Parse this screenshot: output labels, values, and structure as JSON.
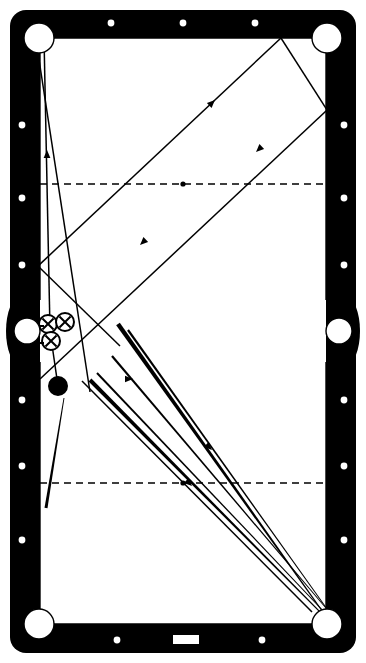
{
  "figure": {
    "type": "billiards-table-diagram",
    "width": 366,
    "height": 663,
    "colors": {
      "rail": "#000000",
      "cloth": "#ffffff",
      "line": "#000000",
      "pocket": "#ffffff"
    }
  },
  "table": {
    "name": "pool-table",
    "outer": {
      "x": 10,
      "y": 10,
      "w": 346,
      "h": 643,
      "radius": 16
    },
    "cushion_inner": {
      "x": 38,
      "y": 36,
      "w": 290,
      "h": 590
    },
    "playfield": {
      "x": 40,
      "y": 38,
      "w": 286,
      "h": 586
    }
  },
  "pockets": [
    {
      "name": "pocket-top-left",
      "cx": 39,
      "cy": 38,
      "r": 15
    },
    {
      "name": "pocket-top-right",
      "cx": 327,
      "cy": 38,
      "r": 15
    },
    {
      "name": "pocket-side-left",
      "cx": 27,
      "cy": 331,
      "r": 13
    },
    {
      "name": "pocket-side-right",
      "cx": 339,
      "cy": 331,
      "r": 13
    },
    {
      "name": "pocket-bottom-left",
      "cx": 39,
      "cy": 624,
      "r": 15
    },
    {
      "name": "pocket-bottom-right",
      "cx": 327,
      "cy": 624,
      "r": 15
    }
  ],
  "diamonds": {
    "top": [
      {
        "cx": 111,
        "cy": 23
      },
      {
        "cx": 183,
        "cy": 23
      },
      {
        "cx": 255,
        "cy": 23
      }
    ],
    "bottom": [
      {
        "cx": 117,
        "cy": 640
      },
      {
        "cx": 262,
        "cy": 640
      }
    ],
    "bottom_center_mark": {
      "x": 173,
      "y": 635,
      "w": 26,
      "h": 9
    },
    "left": [
      {
        "cx": 22,
        "cy": 125
      },
      {
        "cx": 22,
        "cy": 198
      },
      {
        "cx": 22,
        "cy": 265
      },
      {
        "cx": 22,
        "cy": 400
      },
      {
        "cx": 22,
        "cy": 466
      },
      {
        "cx": 22,
        "cy": 540
      }
    ],
    "right": [
      {
        "cx": 344,
        "cy": 125
      },
      {
        "cx": 344,
        "cy": 198
      },
      {
        "cx": 344,
        "cy": 265
      },
      {
        "cx": 344,
        "cy": 400
      },
      {
        "cx": 344,
        "cy": 466
      },
      {
        "cx": 344,
        "cy": 540
      }
    ]
  },
  "strings": [
    {
      "name": "head-string",
      "y": 184,
      "x1": 40,
      "x2": 326,
      "style": "dashed",
      "spot": {
        "cx": 183,
        "cy": 184,
        "r": 2.6
      }
    },
    {
      "name": "foot-string",
      "y": 483,
      "x1": 40,
      "x2": 326,
      "style": "dashed",
      "spot": {
        "cx": 183,
        "cy": 483,
        "r": 2.6
      }
    }
  ],
  "balls": [
    {
      "name": "object-ball-x-1",
      "cx": 48,
      "cy": 324,
      "r": 9,
      "mark": "X",
      "fill": "white"
    },
    {
      "name": "object-ball-x-2",
      "cx": 65,
      "cy": 322,
      "r": 9,
      "mark": "X",
      "fill": "white"
    },
    {
      "name": "object-ball-x-3",
      "cx": 51,
      "cy": 341,
      "r": 9,
      "mark": "X",
      "fill": "white"
    },
    {
      "name": "cue-ball-solid",
      "cx": 58,
      "cy": 386,
      "r": 9,
      "mark": "",
      "fill": "black"
    }
  ],
  "pocket_arrows": [
    {
      "name": "pocket-entry-arrow-upper",
      "x1": 44,
      "y1": 326,
      "x2": 30,
      "y2": 326
    },
    {
      "name": "pocket-entry-arrow-lower",
      "x1": 44,
      "y1": 343,
      "x2": 30,
      "y2": 343
    }
  ],
  "thin_paths": [
    {
      "name": "path-long-bank",
      "points": [
        [
          44,
          38
        ],
        [
          50,
          330
        ]
      ],
      "arrows": [
        {
          "x": 47,
          "y": 150,
          "dir": "up"
        }
      ]
    },
    {
      "name": "path-cue-rail-return",
      "points": [
        [
          36,
          40
        ],
        [
          90,
          392
        ]
      ],
      "arrows": []
    },
    {
      "name": "path-three-rail-a",
      "points": [
        [
          38,
          266
        ],
        [
          281,
          38
        ]
      ],
      "arrows": [
        {
          "x": 215,
          "y": 100,
          "dir": "up-right"
        }
      ]
    },
    {
      "name": "path-three-rail-b",
      "points": [
        [
          281,
          38
        ],
        [
          327,
          110
        ]
      ],
      "arrows": []
    },
    {
      "name": "path-three-rail-c",
      "points": [
        [
          327,
          110
        ],
        [
          40,
          379
        ]
      ],
      "arrows": [
        {
          "x": 140,
          "y": 245,
          "dir": "down-left"
        },
        {
          "x": 256,
          "y": 152,
          "dir": "down-left"
        }
      ]
    },
    {
      "name": "path-kick-short",
      "points": [
        [
          38,
          266
        ],
        [
          120,
          346
        ]
      ],
      "arrows": []
    },
    {
      "name": "path-cue-to-pocket",
      "points": [
        [
          58,
          386
        ],
        [
          50,
          331
        ]
      ],
      "arrows": []
    },
    {
      "name": "path-aim-line",
      "points": [
        [
          82,
          381
        ],
        [
          312,
          612
        ]
      ],
      "arrows": [
        {
          "x": 133,
          "y": 379,
          "dir": "right"
        }
      ]
    }
  ],
  "thick_paths": [
    {
      "name": "stroke-line-1",
      "x1": 118,
      "y1": 324,
      "x2": 330,
      "y2": 622,
      "w1": 4.5,
      "w2": 1.0,
      "arrows": [
        {
          "x": 212,
          "y": 450,
          "dir": "down-right"
        }
      ]
    },
    {
      "name": "stroke-line-2",
      "x1": 90,
      "y1": 380,
      "x2": 328,
      "y2": 620,
      "w1": 4.0,
      "w2": 1.0,
      "arrows": [
        {
          "x": 192,
          "y": 486,
          "dir": "down-right"
        }
      ]
    },
    {
      "name": "stroke-line-3",
      "x1": 97,
      "y1": 373,
      "x2": 330,
      "y2": 618,
      "w1": 2.0,
      "w2": 0.8,
      "arrows": []
    },
    {
      "name": "stroke-line-4",
      "x1": 128,
      "y1": 330,
      "x2": 332,
      "y2": 616,
      "w1": 2.2,
      "w2": 0.8,
      "arrows": []
    },
    {
      "name": "stroke-line-5",
      "x1": 112,
      "y1": 356,
      "x2": 331,
      "y2": 614,
      "w1": 2.2,
      "w2": 0.8,
      "arrows": []
    },
    {
      "name": "stroke-line-6",
      "x1": 46,
      "y1": 508,
      "x2": 64,
      "y2": 398,
      "w1": 3.0,
      "w2": 0.9,
      "arrows": []
    }
  ],
  "legend": {
    "ball_mark_label": "X",
    "notes": ""
  }
}
